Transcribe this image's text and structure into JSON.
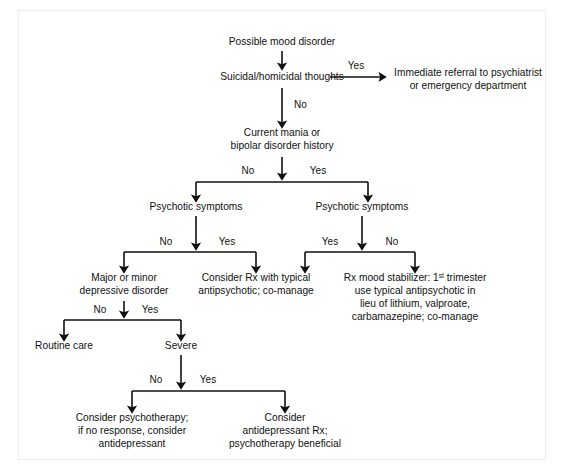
{
  "frame": {
    "border_color": "#ededed",
    "background_color": "#ffffff",
    "ink_color": "#111111"
  },
  "nodes": {
    "start": {
      "lines": [
        "Possible mood disorder"
      ]
    },
    "suicidal": {
      "lines": [
        "Suicidal/homicidal thoughts"
      ]
    },
    "referral": {
      "lines": [
        "Immediate referral to psychiatrist",
        "or emergency department"
      ]
    },
    "mania": {
      "lines": [
        "Current mania or",
        "bipolar disorder history"
      ]
    },
    "psychotic_left": {
      "lines": [
        "Psychotic symptoms"
      ]
    },
    "psychotic_right": {
      "lines": [
        "Psychotic symptoms"
      ]
    },
    "depressive": {
      "lines": [
        "Major or minor",
        "depressive disorder"
      ]
    },
    "consider_rx": {
      "lines": [
        "Consider Rx with typical",
        "antipsychotic; co-manage"
      ]
    },
    "mood_stabilizer": {
      "line1_pre": "Rx mood stabilizer: 1",
      "line1_sup": "st",
      "line1_post": " trimester",
      "lines_rest": [
        "use typical antipsychotic in",
        "lieu of lithium, valproate,",
        "carbamazepine; co-manage"
      ]
    },
    "routine_care": {
      "lines": [
        "Routine care"
      ]
    },
    "severe": {
      "lines": [
        "Severe"
      ]
    },
    "psychotherapy_first": {
      "lines": [
        "Consider psychotherapy;",
        "if no response, consider",
        "antidepressant"
      ]
    },
    "antidepressant_first": {
      "lines": [
        "Consider",
        "antidepressant Rx;",
        "psychotherapy beneficial"
      ]
    }
  },
  "edge_labels": {
    "suicidal_yes": "Yes",
    "suicidal_no": "No",
    "mania_no": "No",
    "mania_yes": "Yes",
    "psychotic_left_no": "No",
    "psychotic_left_yes": "Yes",
    "psychotic_right_yes": "Yes",
    "psychotic_right_no": "No",
    "depressive_no": "No",
    "depressive_yes": "Yes",
    "severe_no": "No",
    "severe_yes": "Yes"
  }
}
